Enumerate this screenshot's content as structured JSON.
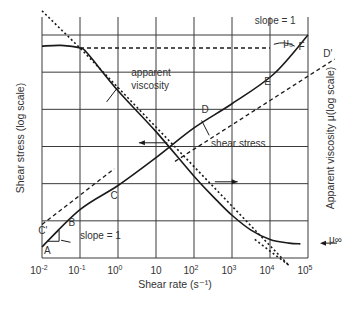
{
  "chart_data": {
    "type": "line",
    "title": "",
    "xlabel": "Shear rate (s⁻¹)",
    "ylabel_left": "Shear stress (log scale)",
    "ylabel_right": "Apparent viscosity μ(log scale)",
    "x_scale": "log",
    "xlim_exponent": [
      -2,
      5
    ],
    "x_ticks": [
      {
        "base": "10",
        "exp": "-2"
      },
      {
        "base": "10",
        "exp": "-1"
      },
      {
        "base": "10",
        "exp": "0"
      },
      {
        "base": "10",
        "exp": ""
      },
      {
        "base": "10",
        "exp": "2"
      },
      {
        "base": "10",
        "exp": "3"
      },
      {
        "base": "10",
        "exp": "4"
      },
      {
        "base": "10",
        "exp": "5"
      }
    ],
    "grid": true,
    "y_grid_divisions": 6,
    "series": [
      {
        "name": "apparent viscosity",
        "style": "solid",
        "points_logx_ydiv": [
          [
            -2,
            5.7
          ],
          [
            -1.5,
            5.72
          ],
          [
            -1,
            5.65
          ],
          [
            -0.8,
            5.5
          ],
          [
            0,
            4.5
          ],
          [
            1,
            3.4
          ],
          [
            2,
            2.2
          ],
          [
            2.6,
            1.55
          ],
          [
            3,
            1.15
          ],
          [
            3.5,
            0.75
          ],
          [
            4,
            0.5
          ],
          [
            4.5,
            0.4
          ],
          [
            4.8,
            0.38
          ]
        ]
      },
      {
        "name": "shear stress",
        "style": "solid",
        "points_logx_ydiv": [
          [
            -2,
            0.3
          ],
          [
            -1,
            1.3
          ],
          [
            0,
            1.95
          ],
          [
            1,
            2.7
          ],
          [
            2,
            3.5
          ],
          [
            3,
            4.15
          ],
          [
            4.1,
            4.95
          ],
          [
            5,
            6.0
          ]
        ]
      },
      {
        "name": "viscosity power-law asymptote",
        "style": "dotted",
        "points_logx_ydiv": [
          [
            -2,
            6.65
          ],
          [
            -1,
            5.65
          ],
          [
            4.5,
            -0.2
          ]
        ]
      },
      {
        "name": "mu0 level",
        "style": "dashed",
        "points_logx_ydiv": [
          [
            -1,
            5.65
          ],
          [
            4.0,
            5.65
          ]
        ]
      },
      {
        "name": "C-C' tangent",
        "style": "dashed",
        "points_logx_ydiv": [
          [
            -2,
            0.9
          ],
          [
            -0.1,
            2.4
          ]
        ]
      },
      {
        "name": "D-D' tangent",
        "style": "dashed",
        "points_logx_ydiv": [
          [
            1.5,
            2.6
          ],
          [
            5.7,
            5.35
          ]
        ]
      }
    ],
    "annotations": [
      {
        "text": "A",
        "at_logx": -1.95,
        "at_ydiv": 0.1
      },
      {
        "text": "B",
        "at_logx": -1.3,
        "at_ydiv": 0.85
      },
      {
        "text": "C",
        "at_logx": -0.2,
        "at_ydiv": 1.6
      },
      {
        "text": "C'",
        "at_logx": -2.1,
        "at_ydiv": 0.65
      },
      {
        "text": "D",
        "at_logx": 2.2,
        "at_ydiv": 3.9
      },
      {
        "text": "D'",
        "at_logx": 5.4,
        "at_ydiv": 5.4
      },
      {
        "text": "E",
        "at_logx": 3.85,
        "at_ydiv": 4.65
      },
      {
        "text": "F",
        "at_logx": 4.75,
        "at_ydiv": 5.6
      },
      {
        "text": "slope = 1",
        "at_logx": -1.0,
        "at_ydiv": 0.5
      },
      {
        "text": "slope = 1",
        "at_logx": 3.6,
        "at_ydiv": 6.3
      },
      {
        "text": "apparent",
        "at_logx": 0.35,
        "at_ydiv": 4.9
      },
      {
        "text": "viscosity",
        "at_logx": 0.35,
        "at_ydiv": 4.55
      },
      {
        "text": "shear stress",
        "at_logx": 2.45,
        "at_ydiv": 3.0
      },
      {
        "text": "μ₀",
        "at_logx": 4.35,
        "at_ydiv": 5.7
      },
      {
        "text": "μ∞",
        "at_logx": 5.55,
        "at_ydiv": 0.4
      }
    ]
  }
}
